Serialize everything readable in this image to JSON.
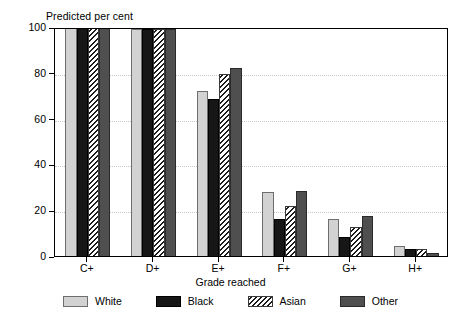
{
  "chart_data": {
    "type": "bar",
    "title": "",
    "ylabel": "Predicted per cent",
    "xlabel": "Grade reached",
    "categories": [
      "C+",
      "D+",
      "E+",
      "F+",
      "G+",
      "H+"
    ],
    "series": [
      {
        "name": "White",
        "color": "#d2d2d2",
        "pattern": "solid",
        "values": [
          100,
          99,
          72,
          28,
          16,
          4.5
        ]
      },
      {
        "name": "Black",
        "color": "#161616",
        "pattern": "solid",
        "values": [
          100,
          99,
          68.5,
          16,
          8.5,
          3
        ]
      },
      {
        "name": "Asian",
        "color": "#ffffff",
        "pattern": "hatch",
        "values": [
          100,
          99,
          79.5,
          22,
          12.5,
          3
        ]
      },
      {
        "name": "Other",
        "color": "#4f4f4f",
        "pattern": "solid",
        "values": [
          100,
          99,
          82,
          28.5,
          17.5,
          1.5
        ]
      }
    ],
    "ylim": [
      0,
      100
    ],
    "yticks": [
      0,
      20,
      40,
      60,
      80,
      100
    ],
    "ytick_labels": [
      "0",
      "20",
      "40",
      "60",
      "80",
      "100"
    ],
    "grid": "horizontal-dotted",
    "legend_position": "bottom-center",
    "frame": "box"
  },
  "legend": {
    "items": [
      {
        "label": "White"
      },
      {
        "label": "Black"
      },
      {
        "label": "Asian"
      },
      {
        "label": "Other"
      }
    ]
  }
}
